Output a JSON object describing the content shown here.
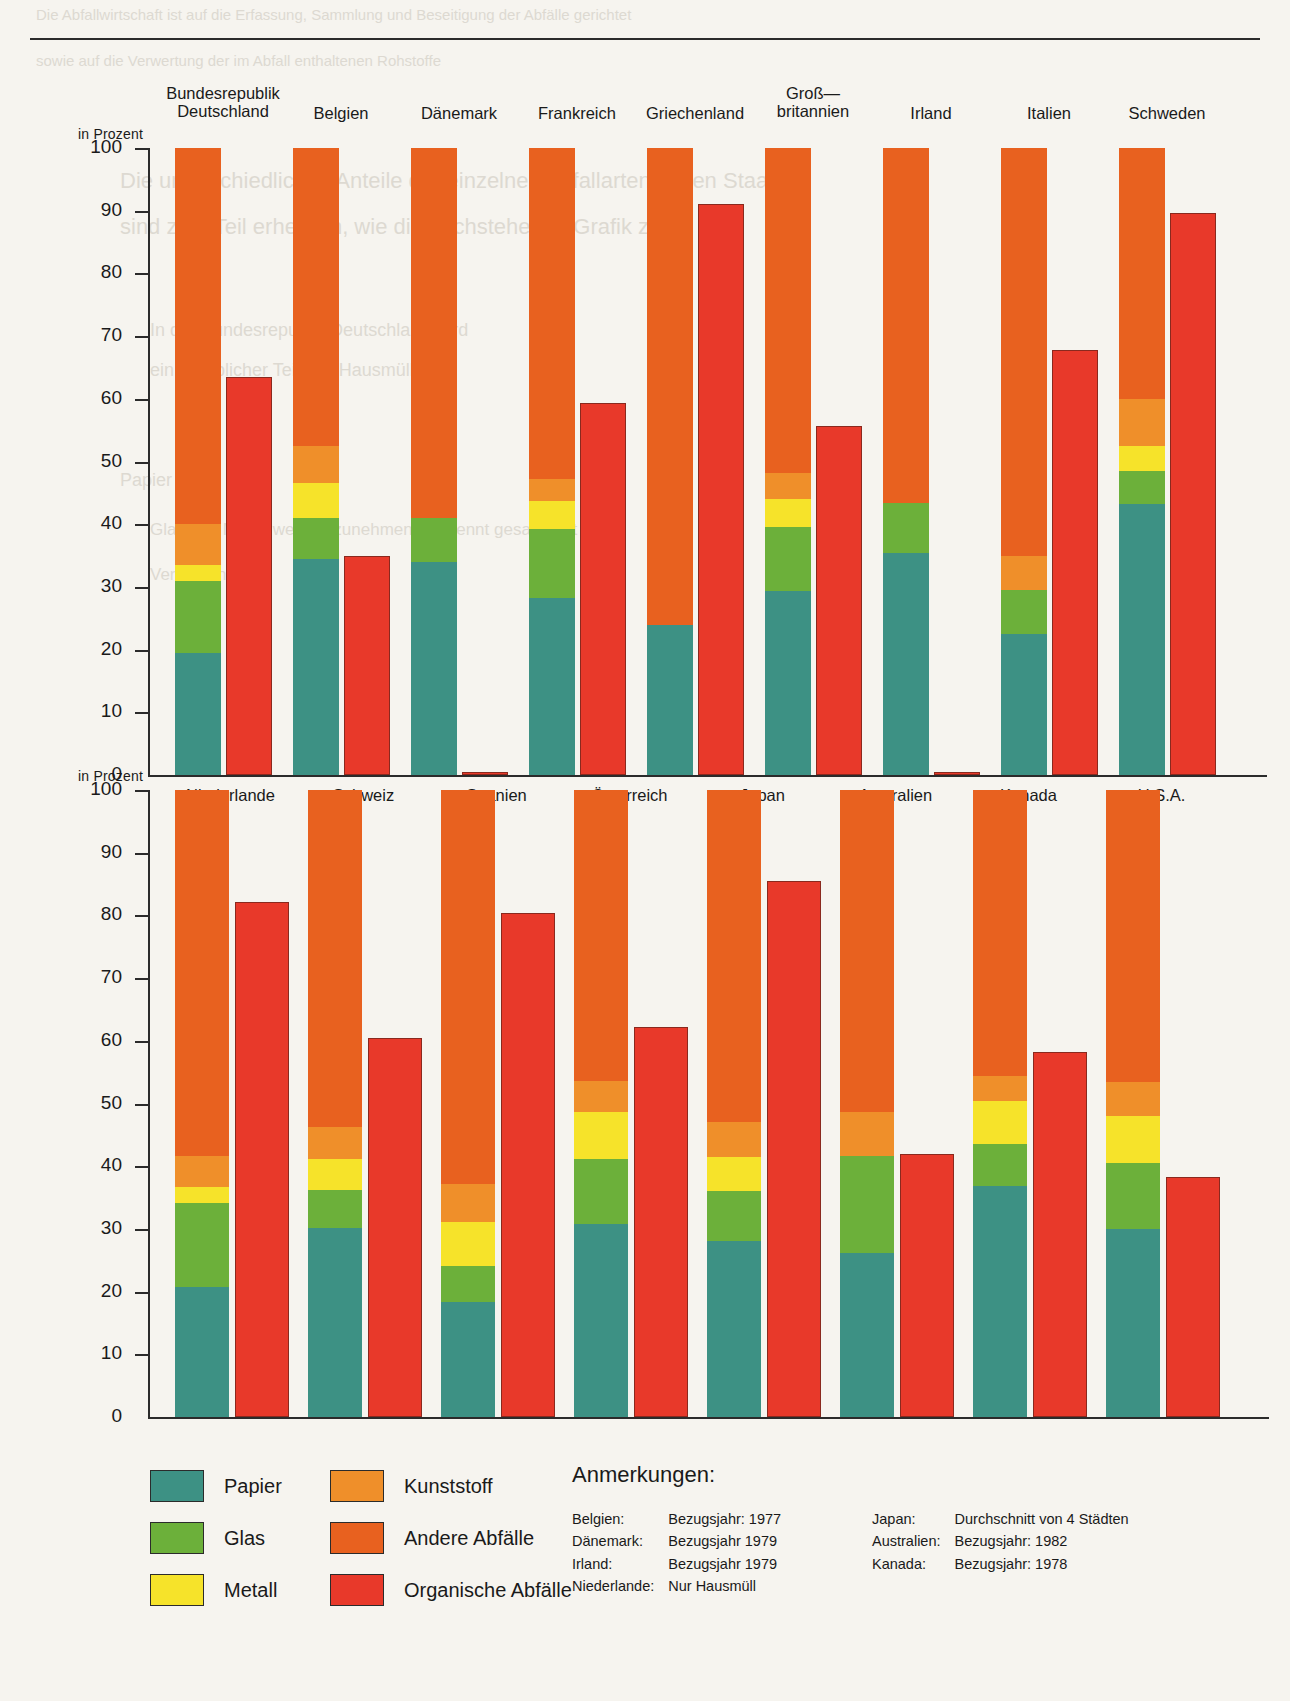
{
  "page": {
    "ghost_lines": [
      {
        "text": "Die Abfallwirtschaft ist auf die Erfassung, Sammlung und Beseitigung der Abfälle gerichtet",
        "x": 36,
        "y": 6,
        "size": 15
      },
      {
        "text": "sowie auf die Verwertung der im Abfall enthaltenen Rohstoffe",
        "x": 36,
        "y": 52,
        "size": 15
      },
      {
        "text": "Die unterschiedlichen Anteile der einzelnen Abfallarten in den Staaten",
        "x": 120,
        "y": 168,
        "size": 22
      },
      {
        "text": "sind zum Teil erheblich, wie die nachstehende Grafik zeigt",
        "x": 120,
        "y": 214,
        "size": 22
      },
      {
        "text": "In der Bundesrepublik Deutschland wird",
        "x": 150,
        "y": 320,
        "size": 18
      },
      {
        "text": "ein erheblicher Teil des Hausmülls",
        "x": 150,
        "y": 360,
        "size": 18
      },
      {
        "text": "Papier",
        "x": 120,
        "y": 470,
        "size": 18
      },
      {
        "text": "Glas und Metall werden zunehmend getrennt gesammelt",
        "x": 150,
        "y": 520,
        "size": 17
      },
      {
        "text": "Verwertung",
        "x": 150,
        "y": 565,
        "size": 17
      }
    ]
  },
  "chart_data": [
    {
      "id": "panel-top",
      "type": "bar",
      "subtype": "stacked-and-single pairs",
      "title": "",
      "xlabel": "",
      "ylabel": "in Prozent",
      "ylim": [
        0,
        100
      ],
      "yticks": [
        0,
        10,
        20,
        30,
        40,
        50,
        60,
        70,
        80,
        90,
        100
      ],
      "grid": false,
      "legend_position": "bottom",
      "series": [
        {
          "name": "Papier",
          "color": "#3d9184"
        },
        {
          "name": "Glas",
          "color": "#6cb03a"
        },
        {
          "name": "Metall",
          "color": "#f6e32a"
        },
        {
          "name": "Kunststoff",
          "color": "#ef8f2a"
        },
        {
          "name": "Andere Abfälle",
          "color": "#e8611f"
        },
        {
          "name": "Organische Abfälle",
          "color": "#e8392a"
        }
      ],
      "categories": [
        "Bundesrepublik\nDeutschland",
        "Belgien",
        "Dänemark",
        "Frankreich",
        "Griechenland",
        "Groß—\nbritannien",
        "Irland",
        "Italien",
        "Schweden"
      ],
      "stacked_values": {
        "Papier": [
          19.5,
          34.5,
          34.0,
          28.2,
          24.0,
          29.3,
          35.4,
          22.5,
          43.3
        ],
        "Glas": [
          11.5,
          6.5,
          7.0,
          11.0,
          0.0,
          10.3,
          8.0,
          7.0,
          5.2
        ],
        "Metall": [
          2.5,
          5.5,
          0.0,
          4.5,
          0.0,
          4.5,
          0.0,
          0.0,
          4.0
        ],
        "Kunststoff": [
          6.5,
          6.0,
          0.0,
          3.5,
          0.0,
          4.0,
          0.0,
          5.5,
          7.5
        ],
        "Andere Abfälle": [
          60.0,
          47.5,
          59.0,
          52.8,
          76.0,
          51.9,
          56.6,
          65.0,
          40.0
        ]
      },
      "organic_values": [
        63.5,
        35.0,
        0.5,
        59.4,
        91.0,
        55.6,
        0.5,
        67.8,
        89.6
      ]
    },
    {
      "id": "panel-bottom",
      "type": "bar",
      "subtype": "stacked-and-single pairs",
      "title": "",
      "xlabel": "",
      "ylabel": "in Prozent",
      "ylim": [
        0,
        100
      ],
      "yticks": [
        0,
        10,
        20,
        30,
        40,
        50,
        60,
        70,
        80,
        90,
        100
      ],
      "grid": false,
      "legend_position": "bottom",
      "series": [
        {
          "name": "Papier",
          "color": "#3d9184"
        },
        {
          "name": "Glas",
          "color": "#6cb03a"
        },
        {
          "name": "Metall",
          "color": "#f6e32a"
        },
        {
          "name": "Kunststoff",
          "color": "#ef8f2a"
        },
        {
          "name": "Andere Abfälle",
          "color": "#e8611f"
        },
        {
          "name": "Organische Abfälle",
          "color": "#e8392a"
        }
      ],
      "categories": [
        "Niederlande",
        "Schweiz",
        "Spanien",
        "Österreich",
        "Japan",
        "Australien",
        "Kanada",
        "U.S.A."
      ],
      "stacked_values": {
        "Papier": [
          20.8,
          30.2,
          18.3,
          30.8,
          28.0,
          26.2,
          36.8,
          30.0
        ],
        "Glas": [
          13.4,
          6.0,
          5.8,
          10.3,
          8.0,
          15.5,
          6.8,
          10.5
        ],
        "Metall": [
          2.5,
          5.0,
          7.0,
          7.5,
          5.5,
          0.0,
          6.8,
          7.5
        ],
        "Kunststoff": [
          5.0,
          5.0,
          6.0,
          5.0,
          5.5,
          7.0,
          4.0,
          5.5
        ],
        "Andere Abfälle": [
          58.3,
          53.8,
          62.9,
          46.4,
          53.0,
          51.3,
          45.6,
          46.5
        ]
      },
      "organic_values": [
        82.2,
        60.4,
        80.4,
        62.2,
        85.5,
        42.0,
        58.2,
        38.3
      ]
    }
  ],
  "legend": {
    "column_left": [
      {
        "label": "Papier",
        "color": "#3d9184"
      },
      {
        "label": "Glas",
        "color": "#6cb03a"
      },
      {
        "label": "Metall",
        "color": "#f6e32a"
      }
    ],
    "column_right": [
      {
        "label": "Kunststoff",
        "color": "#ef8f2a"
      },
      {
        "label": "Andere Abfälle",
        "color": "#e8611f"
      },
      {
        "label": "Organische Abfälle",
        "color": "#e8392a"
      }
    ]
  },
  "notes": {
    "title": "Anmerkungen:",
    "left_rows": [
      {
        "country": "Belgien:",
        "note": "Bezugsjahr: 1977"
      },
      {
        "country": "Dänemark:",
        "note": "Bezugsjahr 1979"
      },
      {
        "country": "Irland:",
        "note": "Bezugsjahr 1979"
      },
      {
        "country": "Niederlande:",
        "note": "Nur Hausmüll"
      }
    ],
    "right_rows": [
      {
        "country": "Japan:",
        "note": "Durchschnitt von 4 Städten"
      },
      {
        "country": "Australien:",
        "note": "Bezugsjahr: 1982"
      },
      {
        "country": "Kanada:",
        "note": "Bezugsjahr: 1978"
      }
    ]
  }
}
